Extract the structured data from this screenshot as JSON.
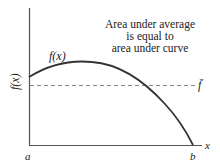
{
  "figure": {
    "annotation": {
      "line1": "Area under average",
      "line2": "is equal to",
      "line3": "area under curve"
    },
    "curve_label": "f(x)",
    "y_axis_label": "f(x)",
    "x_axis_label": "x",
    "average_label": "f̄",
    "x_ticks": {
      "left": "a",
      "right": "b"
    },
    "colors": {
      "axis": "#555555",
      "curve": "#333333",
      "dashed": "#777777",
      "text": "#222222"
    }
  }
}
